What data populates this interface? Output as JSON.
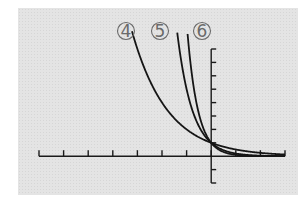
{
  "chart_data": {
    "type": "line",
    "title": "",
    "xlabel": "",
    "ylabel": "",
    "xlim": [
      -7,
      3
    ],
    "ylim": [
      -2,
      8
    ],
    "x_tick_step": 1,
    "y_tick_step": 1,
    "grid": false,
    "legend": "inline labels above curves",
    "series": [
      {
        "name": "4",
        "label": "④",
        "description": "decaying exponential, y = (1/2)^x style, passes (0,1)",
        "base": 0.5
      },
      {
        "name": "5",
        "label": "⑤",
        "description": "steeper decaying exponential, passes (0,1)",
        "base": 0.2
      },
      {
        "name": "6",
        "label": "⑥",
        "description": "steepest decaying exponential, passes (0,1)",
        "base": 0.1
      }
    ]
  },
  "labels": {
    "c4": "4",
    "c5": "5",
    "c6": "6"
  }
}
